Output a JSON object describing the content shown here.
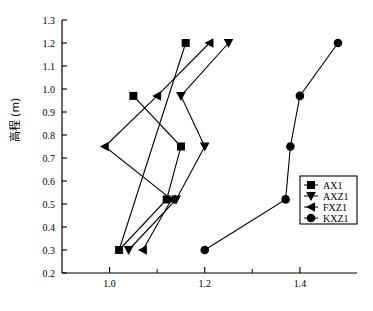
{
  "figure": {
    "ylabel": "高程 (m)",
    "caption": "",
    "background": "#ffffff",
    "line_color": "#000000",
    "axis_color": "#000000"
  },
  "chart_data": {
    "type": "line",
    "title": "",
    "xlabel": "",
    "ylabel": "高程 (m)",
    "xlim": [
      0.9,
      1.52
    ],
    "ylim": [
      0.2,
      1.3
    ],
    "xticks": [
      1.0,
      1.2,
      1.4
    ],
    "xtick_labels": [
      "1.0",
      "1.2",
      "1.4"
    ],
    "xticks_minor": [
      1.1,
      1.3
    ],
    "yticks": [
      0.2,
      0.3,
      0.4,
      0.5,
      0.6,
      0.7,
      0.8,
      0.9,
      1.0,
      1.1,
      1.2,
      1.3
    ],
    "ytick_labels": [
      "0.2",
      "0.3",
      "0.4",
      "0.5",
      "0.6",
      "0.7",
      "0.8",
      "0.9",
      "1.0",
      "1.1",
      "1.2",
      "1.3"
    ],
    "grid": false,
    "legend_position": "lower right",
    "series": [
      {
        "name": "AX1",
        "marker": "square",
        "x": [
          1.05,
          1.15,
          1.12,
          1.02,
          1.16
        ],
        "y": [
          0.97,
          0.75,
          0.52,
          0.3,
          1.2
        ]
      },
      {
        "name": "AXZ1",
        "marker": "triangle-down",
        "x": [
          1.25,
          1.15,
          1.2,
          1.14,
          1.04
        ],
        "y": [
          1.2,
          0.97,
          0.75,
          0.52,
          0.3
        ]
      },
      {
        "name": "FXZ1",
        "marker": "triangle-left",
        "x": [
          1.21,
          1.1,
          0.99,
          1.13,
          1.07
        ],
        "y": [
          1.2,
          0.97,
          0.75,
          0.52,
          0.3
        ]
      },
      {
        "name": "KXZ1",
        "marker": "circle",
        "x": [
          1.48,
          1.4,
          1.38,
          1.37,
          1.2
        ],
        "y": [
          1.2,
          0.97,
          0.75,
          0.52,
          0.3
        ]
      }
    ]
  },
  "legend": {
    "items": [
      {
        "label": "AX1",
        "marker": "square"
      },
      {
        "label": "AXZ1",
        "marker": "triangle-down"
      },
      {
        "label": "FXZ1",
        "marker": "triangle-left"
      },
      {
        "label": "KXZ1",
        "marker": "circle"
      }
    ]
  }
}
